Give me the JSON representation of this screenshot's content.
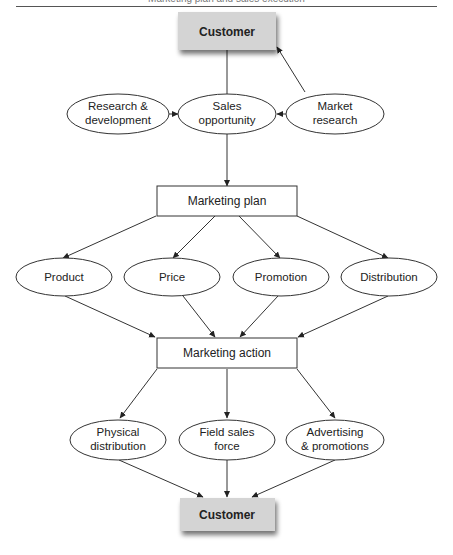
{
  "header": {
    "running_head": "Marketing plan and sales execution"
  },
  "diagram": {
    "nodes": {
      "customer_top": {
        "label": "Customer",
        "shape": "shaded-box"
      },
      "research_dev": {
        "label_line1": "Research &",
        "label_line2": "development",
        "shape": "ellipse"
      },
      "sales_opportunity": {
        "label_line1": "Sales",
        "label_line2": "opportunity",
        "shape": "ellipse"
      },
      "market_research": {
        "label_line1": "Market",
        "label_line2": "research",
        "shape": "ellipse"
      },
      "marketing_plan": {
        "label": "Marketing plan",
        "shape": "box"
      },
      "product": {
        "label": "Product",
        "shape": "ellipse"
      },
      "price": {
        "label": "Price",
        "shape": "ellipse"
      },
      "promotion": {
        "label": "Promotion",
        "shape": "ellipse"
      },
      "distribution": {
        "label": "Distribution",
        "shape": "ellipse"
      },
      "marketing_action": {
        "label": "Marketing action",
        "shape": "box"
      },
      "physical_distribution": {
        "label_line1": "Physical",
        "label_line2": "distribution",
        "shape": "ellipse"
      },
      "field_sales_force": {
        "label_line1": "Field sales",
        "label_line2": "force",
        "shape": "ellipse"
      },
      "advertising_promotions": {
        "label_line1": "Advertising",
        "label_line2": "& promotions",
        "shape": "ellipse"
      },
      "customer_bottom": {
        "label": "Customer",
        "shape": "shaded-box"
      }
    },
    "edges": [
      {
        "from": "customer_top",
        "to": "sales_opportunity"
      },
      {
        "from": "market_research",
        "to": "customer_top"
      },
      {
        "from": "research_dev",
        "to": "sales_opportunity"
      },
      {
        "from": "market_research",
        "to": "sales_opportunity"
      },
      {
        "from": "sales_opportunity",
        "to": "marketing_plan"
      },
      {
        "from": "marketing_plan",
        "to": "product"
      },
      {
        "from": "marketing_plan",
        "to": "price"
      },
      {
        "from": "marketing_plan",
        "to": "promotion"
      },
      {
        "from": "marketing_plan",
        "to": "distribution"
      },
      {
        "from": "product",
        "to": "marketing_action"
      },
      {
        "from": "price",
        "to": "marketing_action"
      },
      {
        "from": "promotion",
        "to": "marketing_action"
      },
      {
        "from": "distribution",
        "to": "marketing_action"
      },
      {
        "from": "marketing_action",
        "to": "physical_distribution"
      },
      {
        "from": "marketing_action",
        "to": "field_sales_force"
      },
      {
        "from": "marketing_action",
        "to": "advertising_promotions"
      },
      {
        "from": "physical_distribution",
        "to": "customer_bottom"
      },
      {
        "from": "field_sales_force",
        "to": "customer_bottom"
      },
      {
        "from": "advertising_promotions",
        "to": "customer_bottom"
      }
    ],
    "colors": {
      "customer_fill": "#d4d4d4",
      "stroke": "#333333",
      "background": "#ffffff"
    }
  }
}
